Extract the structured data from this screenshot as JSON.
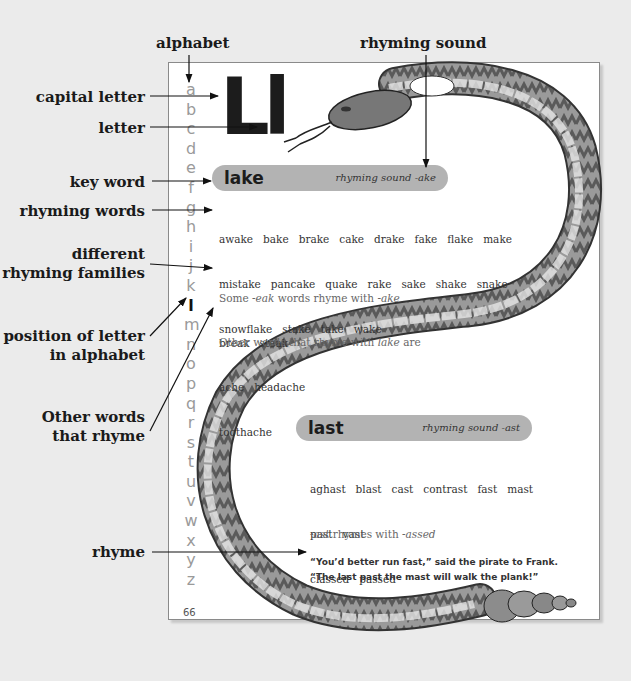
{
  "callouts": {
    "alphabet": "alphabet",
    "rhyming_sound": "rhyming sound",
    "capital_letter": "capital letter",
    "letter": "letter",
    "key_word": "key word",
    "rhyming_words": "rhyming words",
    "different_families_1": "different",
    "different_families_2": "rhyming families",
    "position_1": "position of letter",
    "position_2": "in alphabet",
    "other_words_1": "Other words",
    "other_words_2": "that rhyme",
    "rhyme": "rhyme"
  },
  "page": {
    "alphabet": [
      "a",
      "b",
      "c",
      "d",
      "e",
      "f",
      "g",
      "h",
      "i",
      "j",
      "k",
      "l",
      "m",
      "n",
      "o",
      "p",
      "q",
      "r",
      "s",
      "t",
      "u",
      "v",
      "w",
      "x",
      "y",
      "z"
    ],
    "current_letter": "l",
    "page_number": "66",
    "big_letter": "Ll",
    "entries": [
      {
        "key_word": "lake",
        "rhyming_sound": "rhyming sound -ake",
        "words_lines": [
          "awake   bake   brake   cake   drake   fake   flake   make",
          "mistake   pancake   quake   rake   sake   shake   snake",
          "snowflake   stake   take   wake"
        ],
        "family_intro_1": "Some ",
        "family_intro_italic": "-eak",
        "family_intro_2": " words rhyme with ",
        "family_intro_italic2": "-ake",
        "family_words": "break   steak",
        "other_intro_1": "Other words that rhyme with ",
        "other_intro_italic": "lake",
        "other_intro_2": " are",
        "other_words_line1": "ache   headache",
        "other_words_line2": "toothache"
      },
      {
        "key_word": "last",
        "rhyming_sound": "rhyming sound -ast",
        "words_lines": [
          "aghast   blast   cast   contrast   fast   mast",
          "past   vast"
        ],
        "family_italic": "-ast",
        "family_mid": " rhymes with ",
        "family_italic2": "-assed",
        "family_words": "classed   passed",
        "rhyme_line1": "“You’d better run fast,” said the pirate to Frank.",
        "rhyme_line2": "“The last past the mast will walk the plank!”"
      }
    ]
  }
}
